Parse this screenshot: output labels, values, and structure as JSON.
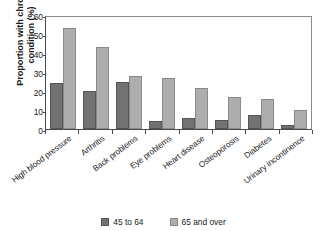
{
  "chart_data": {
    "type": "bar",
    "title": "",
    "xlabel": "",
    "ylabel": "Proportion with chronic\ncondition (%)",
    "ylim": [
      0,
      60
    ],
    "yticks": [
      0,
      10,
      20,
      30,
      40,
      50,
      60
    ],
    "ytick_labels": [
      "0",
      "10",
      "20",
      "30",
      "40",
      "50",
      "60"
    ],
    "grid": false,
    "legend_position": "bottom",
    "categories": [
      "High blood pressure",
      "Arthritis",
      "Back problems",
      "Eye problems",
      "Heart disease",
      "Osteoporosis",
      "Diabetes",
      "Urinary incontinence"
    ],
    "series": [
      {
        "name": "45 to 64",
        "color": "#727272",
        "values": [
          24,
          20,
          24.5,
          4,
          6,
          5,
          7.5,
          2
        ]
      },
      {
        "name": "65 and over",
        "color": "#adadad",
        "values": [
          53,
          43,
          28,
          27,
          21.5,
          17,
          16,
          10
        ]
      }
    ]
  },
  "axis": {
    "frame_color": "#4a4a4a"
  }
}
